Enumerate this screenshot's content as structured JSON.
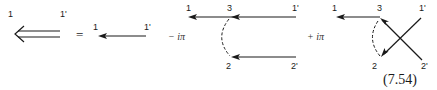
{
  "equation": {
    "number": "(7.54)",
    "equals_sign": "=",
    "term2_coefficient": "− iπ",
    "term3_coefficient": "+ iπ"
  },
  "diagram_lhs": {
    "type": "double-line propagator",
    "labels": {
      "left": "1",
      "right": "1'"
    }
  },
  "diagram_free": {
    "type": "single propagator",
    "labels": {
      "left": "1",
      "right": "1'"
    }
  },
  "diagram_ladder": {
    "type": "propagators with dashed interaction",
    "labels": {
      "top_left": "1",
      "vertex": "3",
      "top_right": "1'",
      "bottom_left": "2",
      "bottom_right": "2'"
    }
  },
  "diagram_exchange": {
    "type": "crossed propagators with dashed interaction",
    "labels": {
      "top_left": "1",
      "vertex": "3",
      "top_right": "1'",
      "bottom_left": "2",
      "bottom_right": "2'"
    }
  },
  "colors": {
    "ink": "#1a1a1a",
    "background": "#ffffff"
  }
}
